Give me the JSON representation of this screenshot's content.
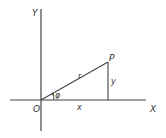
{
  "diagram": {
    "type": "polar-cartesian-coordinates",
    "labels": {
      "y_axis": "Y",
      "x_axis": "X",
      "origin": "O",
      "point": "P",
      "radius": "r",
      "x_length": "x",
      "y_length": "y",
      "angle": "φ"
    },
    "colors": {
      "line": "#444444",
      "text": "#333333",
      "background": "#ffffff"
    }
  }
}
